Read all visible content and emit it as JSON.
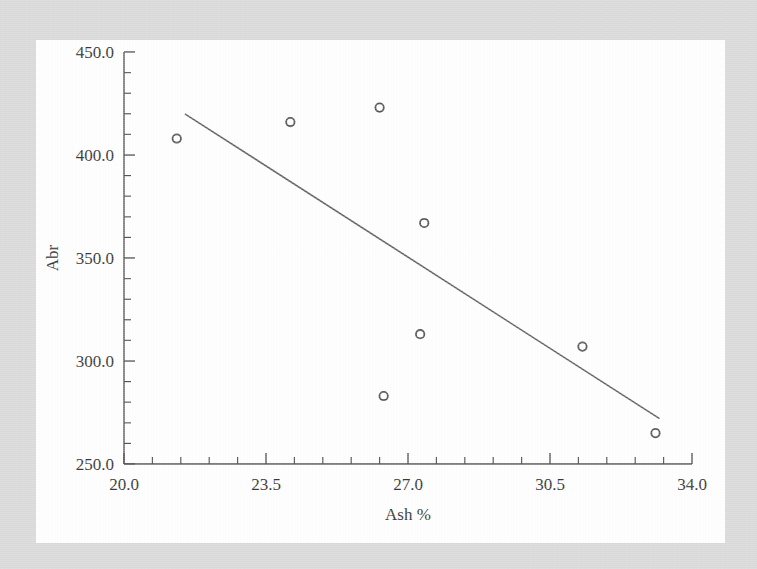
{
  "figure": {
    "background_color": "#d8d8d8",
    "panel_color": "#ffffff",
    "ink_color": "#4a4a4a"
  },
  "chart_data": {
    "type": "scatter",
    "title": "",
    "xlabel": "Ash %",
    "ylabel": "Abr",
    "xlim": [
      20.0,
      34.0
    ],
    "ylim": [
      250.0,
      450.0
    ],
    "xticks": [
      "20.0",
      "23.5",
      "27.0",
      "30.5",
      "34.0"
    ],
    "xtick_values": [
      20.0,
      23.5,
      27.0,
      30.5,
      34.0
    ],
    "yticks": [
      "250.0",
      "300.0",
      "350.0",
      "400.0",
      "450.0"
    ],
    "ytick_values": [
      250.0,
      300.0,
      350.0,
      400.0,
      450.0
    ],
    "x_minor_per_major": 5,
    "y_minor_per_major": 5,
    "grid": false,
    "legend": false,
    "marker_style": "open-circle",
    "points": [
      {
        "x": 21.3,
        "y": 408.0
      },
      {
        "x": 24.1,
        "y": 416.0
      },
      {
        "x": 26.3,
        "y": 423.0
      },
      {
        "x": 26.4,
        "y": 283.0
      },
      {
        "x": 27.3,
        "y": 313.0
      },
      {
        "x": 27.4,
        "y": 367.0
      },
      {
        "x": 31.3,
        "y": 307.0
      },
      {
        "x": 33.1,
        "y": 265.0
      }
    ],
    "series": [
      {
        "name": "Abr vs Ash %",
        "x": [
          21.3,
          24.1,
          26.3,
          26.4,
          27.3,
          27.4,
          31.3,
          33.1
        ],
        "values": [
          408.0,
          416.0,
          423.0,
          283.0,
          313.0,
          367.0,
          307.0,
          265.0
        ]
      }
    ],
    "trend_line": {
      "type": "linear-fit",
      "x_start": 21.5,
      "y_start": 420.0,
      "x_end": 33.2,
      "y_end": 272.0
    }
  }
}
